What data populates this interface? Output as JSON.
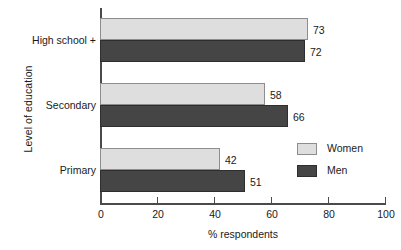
{
  "chart_data": {
    "type": "bar",
    "orientation": "horizontal",
    "title": "",
    "xlabel": "% respondents",
    "ylabel": "Level of education",
    "categories": [
      "High school +",
      "Secondary",
      "Primary"
    ],
    "series": [
      {
        "name": "Women",
        "color": "#dedede",
        "values": [
          73,
          58,
          42
        ]
      },
      {
        "name": "Men",
        "color": "#454545",
        "values": [
          72,
          66,
          51
        ]
      }
    ],
    "xlim": [
      0,
      100
    ],
    "xticks": [
      0,
      20,
      40,
      60,
      80,
      100
    ],
    "xtick_labels": [
      "0",
      "20",
      "40",
      "60",
      "80",
      "100"
    ],
    "grid": false,
    "legend_position": "inside-bottom-right",
    "value_labels": true
  },
  "legend": {
    "entries": [
      {
        "label": "Women"
      },
      {
        "label": "Men"
      }
    ]
  }
}
